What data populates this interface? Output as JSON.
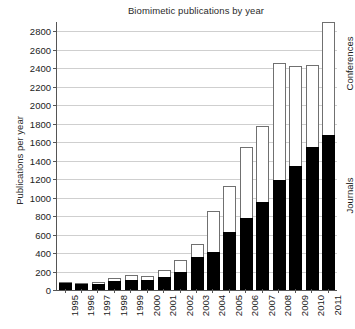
{
  "chart_data": {
    "type": "bar",
    "subtype": "stacked",
    "title": "Biomimetic publications by year",
    "xlabel": "",
    "ylabel": "Publications per year",
    "ylim": [
      0,
      2900
    ],
    "yticks": [
      0,
      200,
      400,
      600,
      800,
      1000,
      1200,
      1400,
      1600,
      1800,
      2000,
      2200,
      2400,
      2600,
      2800
    ],
    "ytick_labels": [
      "0",
      "200",
      "400",
      "600",
      "800",
      "1000",
      "1200",
      "1400",
      "1600",
      "1800",
      "2000",
      "2200",
      "2400",
      "2600",
      "2800"
    ],
    "grid": true,
    "grid_axis": "y",
    "legend_position": "right-outside",
    "categories": [
      "1995",
      "1996",
      "1997",
      "1998",
      "1999",
      "2000",
      "2001",
      "2002",
      "2003",
      "2004",
      "2005",
      "2006",
      "2007",
      "2008",
      "2009",
      "2010",
      "2011"
    ],
    "series": [
      {
        "name": "Journals",
        "color": "#000000",
        "values": [
          75,
          60,
          65,
          95,
          105,
          105,
          140,
          195,
          355,
          415,
          625,
          775,
          955,
          1195,
          1340,
          1545,
          1675
        ]
      },
      {
        "name": "Conferences",
        "color": "#ffffff",
        "values": [
          15,
          5,
          20,
          35,
          60,
          45,
          75,
          125,
          145,
          440,
          500,
          775,
          820,
          1265,
          1085,
          890,
          1225
        ]
      }
    ],
    "totals": [
      90,
      65,
      85,
      130,
      165,
      150,
      215,
      320,
      500,
      855,
      1125,
      1550,
      1775,
      2460,
      2425,
      2435,
      2900
    ],
    "annotations": []
  },
  "side_labels": {
    "conferences": "Conferences",
    "journals": "Journals"
  }
}
